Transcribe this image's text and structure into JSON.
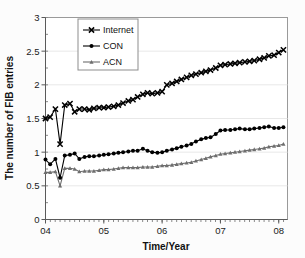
{
  "figure": {
    "background": "#fcfcfc",
    "plot_background": "#ffffff"
  },
  "chart_data": {
    "type": "line",
    "title": "",
    "xlabel": "Time/Year",
    "ylabel": "The number of FIB entries",
    "xlim": [
      2004.0,
      2008.15
    ],
    "ylim": [
      0,
      3
    ],
    "yticks": [
      0,
      0.5,
      1,
      1.5,
      2,
      2.5,
      3
    ],
    "ytick_labels": [
      "0",
      "0.5",
      "1",
      "1.5",
      "2",
      "2.5",
      "3"
    ],
    "xticks": [
      2004,
      2005,
      2006,
      2007,
      2008
    ],
    "xtick_labels": [
      "04",
      "05",
      "06",
      "07",
      "08"
    ],
    "grid": false,
    "legend_position": "top-left",
    "minor_tick_interval": 0.0833,
    "units_note": "",
    "colors": {
      "internet": "#000000",
      "con": "#000000",
      "acn": "#6e6e6e"
    },
    "series": [
      {
        "name": "Internet",
        "marker": "x",
        "color": "#000000",
        "x": [
          2004.0,
          2004.08,
          2004.17,
          2004.25,
          2004.33,
          2004.42,
          2004.5,
          2004.58,
          2004.67,
          2004.75,
          2004.83,
          2004.92,
          2005.0,
          2005.08,
          2005.17,
          2005.25,
          2005.33,
          2005.42,
          2005.5,
          2005.58,
          2005.67,
          2005.75,
          2005.83,
          2005.92,
          2006.0,
          2006.08,
          2006.17,
          2006.25,
          2006.33,
          2006.42,
          2006.5,
          2006.58,
          2006.67,
          2006.75,
          2006.83,
          2006.92,
          2007.0,
          2007.08,
          2007.17,
          2007.25,
          2007.33,
          2007.42,
          2007.5,
          2007.58,
          2007.67,
          2007.75,
          2007.83,
          2007.92,
          2008.0,
          2008.08
        ],
        "y": [
          1.5,
          1.52,
          1.64,
          1.12,
          1.7,
          1.72,
          1.6,
          1.64,
          1.64,
          1.63,
          1.65,
          1.66,
          1.66,
          1.67,
          1.68,
          1.7,
          1.73,
          1.76,
          1.78,
          1.82,
          1.86,
          1.88,
          1.87,
          1.88,
          1.9,
          2.0,
          2.02,
          2.05,
          2.08,
          2.11,
          2.14,
          2.16,
          2.18,
          2.2,
          2.22,
          2.25,
          2.29,
          2.3,
          2.31,
          2.32,
          2.33,
          2.34,
          2.35,
          2.36,
          2.38,
          2.4,
          2.43,
          2.44,
          2.48,
          2.52
        ]
      },
      {
        "name": "CON",
        "marker": "circle",
        "color": "#000000",
        "x": [
          2004.0,
          2004.08,
          2004.17,
          2004.25,
          2004.33,
          2004.42,
          2004.5,
          2004.58,
          2004.67,
          2004.75,
          2004.83,
          2004.92,
          2005.0,
          2005.08,
          2005.17,
          2005.25,
          2005.33,
          2005.42,
          2005.5,
          2005.58,
          2005.67,
          2005.75,
          2005.83,
          2005.92,
          2006.0,
          2006.08,
          2006.17,
          2006.25,
          2006.33,
          2006.42,
          2006.5,
          2006.58,
          2006.67,
          2006.75,
          2006.83,
          2006.92,
          2007.0,
          2007.08,
          2007.17,
          2007.25,
          2007.33,
          2007.42,
          2007.5,
          2007.58,
          2007.67,
          2007.75,
          2007.83,
          2007.92,
          2008.0,
          2008.08
        ],
        "y": [
          0.89,
          0.82,
          0.9,
          0.62,
          0.95,
          0.96,
          0.98,
          0.9,
          0.93,
          0.94,
          0.94,
          0.95,
          0.96,
          0.97,
          0.98,
          0.99,
          1.0,
          1.01,
          1.02,
          1.02,
          1.05,
          1.02,
          1.0,
          0.99,
          1.0,
          1.02,
          1.04,
          1.06,
          1.08,
          1.1,
          1.12,
          1.16,
          1.19,
          1.21,
          1.22,
          1.27,
          1.32,
          1.33,
          1.33,
          1.34,
          1.35,
          1.34,
          1.34,
          1.35,
          1.36,
          1.37,
          1.38,
          1.36,
          1.36,
          1.37
        ]
      },
      {
        "name": "ACN",
        "marker": "triangle",
        "color": "#6e6e6e",
        "x": [
          2004.0,
          2004.08,
          2004.17,
          2004.25,
          2004.33,
          2004.42,
          2004.5,
          2004.58,
          2004.67,
          2004.75,
          2004.83,
          2004.92,
          2005.0,
          2005.08,
          2005.17,
          2005.25,
          2005.33,
          2005.42,
          2005.5,
          2005.58,
          2005.67,
          2005.75,
          2005.83,
          2005.92,
          2006.0,
          2006.08,
          2006.17,
          2006.25,
          2006.33,
          2006.42,
          2006.5,
          2006.58,
          2006.67,
          2006.75,
          2006.83,
          2006.92,
          2007.0,
          2007.08,
          2007.17,
          2007.25,
          2007.33,
          2007.42,
          2007.5,
          2007.58,
          2007.67,
          2007.75,
          2007.83,
          2007.92,
          2008.0,
          2008.08
        ],
        "y": [
          0.7,
          0.7,
          0.71,
          0.5,
          0.76,
          0.76,
          0.75,
          0.71,
          0.72,
          0.72,
          0.72,
          0.73,
          0.74,
          0.74,
          0.75,
          0.76,
          0.77,
          0.77,
          0.77,
          0.77,
          0.78,
          0.78,
          0.78,
          0.79,
          0.8,
          0.8,
          0.81,
          0.82,
          0.83,
          0.84,
          0.85,
          0.87,
          0.89,
          0.91,
          0.93,
          0.95,
          0.97,
          0.98,
          0.99,
          1.0,
          1.01,
          1.02,
          1.03,
          1.04,
          1.05,
          1.06,
          1.08,
          1.09,
          1.1,
          1.12
        ]
      }
    ]
  },
  "legend": {
    "entries": [
      {
        "label": "Internet",
        "marker": "x",
        "color": "#000000"
      },
      {
        "label": "CON",
        "marker": "circle",
        "color": "#000000"
      },
      {
        "label": "ACN",
        "marker": "triangle",
        "color": "#6e6e6e"
      }
    ]
  }
}
